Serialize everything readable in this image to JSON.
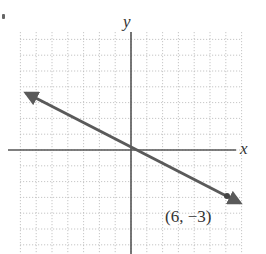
{
  "chart_data": {
    "type": "line",
    "title": "",
    "xlabel": "x",
    "ylabel": "y",
    "xlim": [
      -7,
      7
    ],
    "ylim": [
      -6,
      7.5
    ],
    "grid": true,
    "grid_style": "dotted",
    "series": [
      {
        "name": "line through origin",
        "slope": -0.5,
        "intercept": 0,
        "x": [
          -6.6,
          0,
          6,
          6.4
        ],
        "y": [
          3.3,
          0,
          -3,
          -3.2
        ],
        "arrows": "both",
        "color": "#555555"
      }
    ],
    "points": [
      {
        "x": 6,
        "y": -3,
        "label": "(6, −3)"
      }
    ],
    "annotations": [
      {
        "text": "(6, −3)",
        "x": 6,
        "y": -3,
        "position": "below-left"
      }
    ]
  },
  "labels": {
    "x_axis": "x",
    "y_axis": "y",
    "point_label": "(6, −3)"
  },
  "colors": {
    "grid": "#b8b8b8",
    "axis": "#555555",
    "line": "#5a5a5a",
    "text": "#333333"
  }
}
